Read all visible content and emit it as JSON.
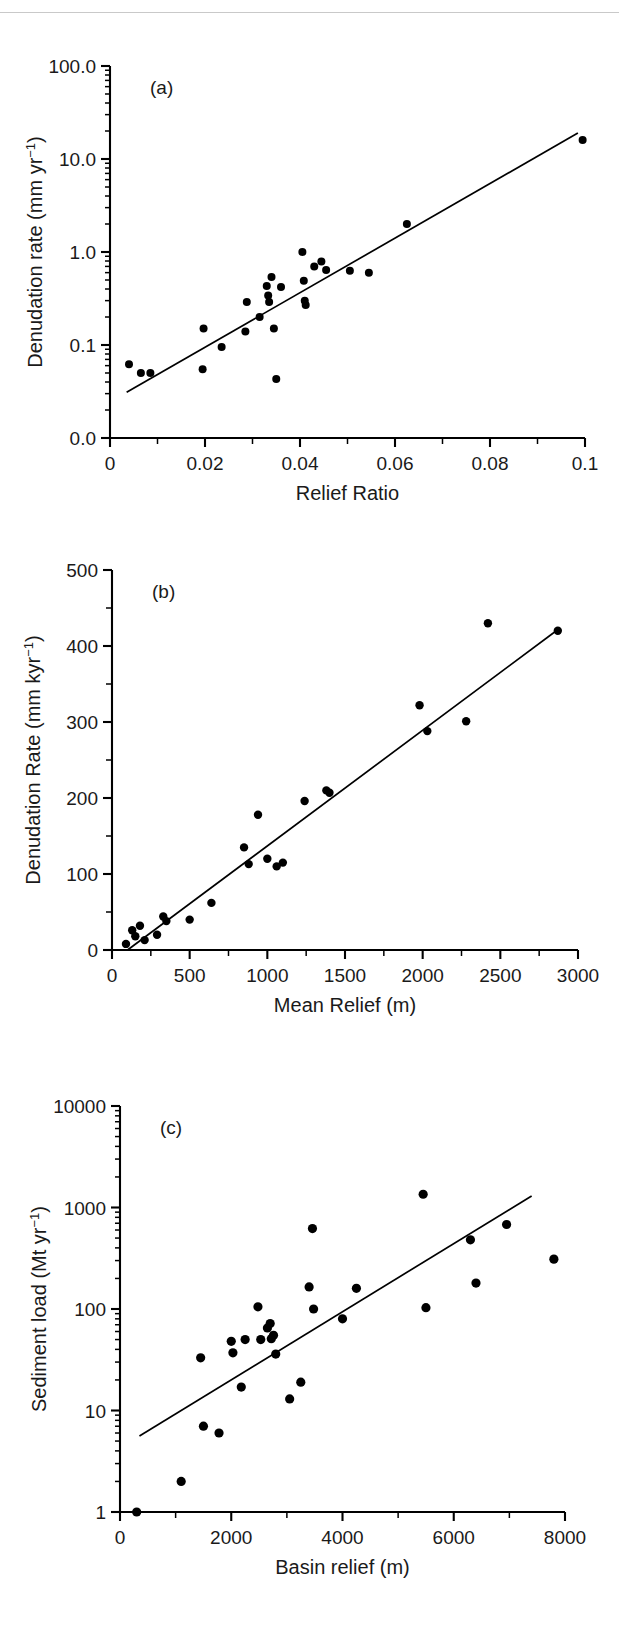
{
  "figure": {
    "background": "#ffffff",
    "rule_color": "#c9c9c9",
    "marker_color": "#000000",
    "line_color": "#000000"
  },
  "panels": [
    {
      "tag": "(a)",
      "xlabel": "Relief Ratio",
      "ylabel_main": "Denudation rate (mm yr",
      "ylabel_sup": "−1",
      "ylabel_close": ")",
      "ylabel_full": "Denudation rate (mm yr⁻¹)",
      "xticks": [
        "0",
        "0.02",
        "0.04",
        "0.06",
        "0.08",
        "0.1"
      ],
      "yticks": [
        "100.0",
        "10.0",
        "1.0",
        "0.1",
        "0.0"
      ]
    },
    {
      "tag": "(b)",
      "xlabel": "Mean Relief (m)",
      "ylabel_main": "Denudation Rate (mm kyr",
      "ylabel_sup": "−1",
      "ylabel_close": ")",
      "ylabel_full": "Denudation Rate (mm kyr⁻¹)",
      "xticks": [
        "0",
        "500",
        "1000",
        "1500",
        "2000",
        "2500",
        "3000"
      ],
      "yticks": [
        "500",
        "400",
        "300",
        "200",
        "100",
        "0"
      ]
    },
    {
      "tag": "(c)",
      "xlabel": "Basin relief (m)",
      "ylabel_main": "Sediment load (Mt yr",
      "ylabel_sup": "−1",
      "ylabel_close": ")",
      "ylabel_full": "Sediment load (Mt yr⁻¹)",
      "xticks": [
        "0",
        "2000",
        "4000",
        "6000",
        "8000"
      ],
      "yticks": [
        "10000",
        "1000",
        "100",
        "10",
        "1"
      ]
    }
  ],
  "chart_data": [
    {
      "type": "scatter",
      "panel": "a",
      "title": "(a)",
      "xlabel": "Relief Ratio",
      "ylabel": "Denudation rate (mm yr⁻¹)",
      "xlim": [
        0,
        0.1
      ],
      "ylim": [
        0.01,
        100
      ],
      "yscale": "log",
      "xscale": "linear",
      "grid": false,
      "legend": null,
      "xticks": [
        0,
        0.02,
        0.04,
        0.06,
        0.08,
        0.1
      ],
      "xtick_labels": [
        "0",
        "0.02",
        "0.04",
        "0.06",
        "0.08",
        "0.1"
      ],
      "yticks": [
        0.01,
        0.1,
        1,
        10,
        100
      ],
      "ytick_labels": [
        "0.0",
        "0.1",
        "1.0",
        "10.0",
        "100.0"
      ],
      "points": [
        {
          "x": 0.004,
          "y": 0.062
        },
        {
          "x": 0.0065,
          "y": 0.05
        },
        {
          "x": 0.0085,
          "y": 0.05
        },
        {
          "x": 0.0195,
          "y": 0.055
        },
        {
          "x": 0.0197,
          "y": 0.15
        },
        {
          "x": 0.0235,
          "y": 0.095
        },
        {
          "x": 0.0285,
          "y": 0.14
        },
        {
          "x": 0.0288,
          "y": 0.29
        },
        {
          "x": 0.0315,
          "y": 0.2
        },
        {
          "x": 0.033,
          "y": 0.43
        },
        {
          "x": 0.0333,
          "y": 0.34
        },
        {
          "x": 0.0335,
          "y": 0.29
        },
        {
          "x": 0.034,
          "y": 0.54
        },
        {
          "x": 0.0345,
          "y": 0.15
        },
        {
          "x": 0.035,
          "y": 0.043
        },
        {
          "x": 0.036,
          "y": 0.42
        },
        {
          "x": 0.0405,
          "y": 1.0
        },
        {
          "x": 0.0408,
          "y": 0.49
        },
        {
          "x": 0.041,
          "y": 0.3
        },
        {
          "x": 0.0412,
          "y": 0.27
        },
        {
          "x": 0.043,
          "y": 0.7
        },
        {
          "x": 0.0445,
          "y": 0.79
        },
        {
          "x": 0.0455,
          "y": 0.64
        },
        {
          "x": 0.0505,
          "y": 0.63
        },
        {
          "x": 0.0625,
          "y": 2.0
        },
        {
          "x": 0.0545,
          "y": 0.6
        },
        {
          "x": 0.0995,
          "y": 16.0
        }
      ],
      "fit_line": {
        "x0": 0.0035,
        "y0": 0.031,
        "x1": 0.0985,
        "y1": 19.0
      }
    },
    {
      "type": "scatter",
      "panel": "b",
      "title": "(b)",
      "xlabel": "Mean Relief (m)",
      "ylabel": "Denudation Rate (mm kyr⁻¹)",
      "xlim": [
        0,
        3000
      ],
      "ylim": [
        0,
        500
      ],
      "yscale": "linear",
      "xscale": "linear",
      "grid": false,
      "legend": null,
      "xticks": [
        0,
        500,
        1000,
        1500,
        2000,
        2500,
        3000
      ],
      "xtick_labels": [
        "0",
        "500",
        "1000",
        "1500",
        "2000",
        "2500",
        "3000"
      ],
      "yticks": [
        0,
        100,
        200,
        300,
        400,
        500
      ],
      "ytick_labels": [
        "0",
        "100",
        "200",
        "300",
        "400",
        "500"
      ],
      "points": [
        {
          "x": 90,
          "y": 8
        },
        {
          "x": 130,
          "y": 26
        },
        {
          "x": 150,
          "y": 18
        },
        {
          "x": 180,
          "y": 32
        },
        {
          "x": 210,
          "y": 13
        },
        {
          "x": 290,
          "y": 20
        },
        {
          "x": 330,
          "y": 44
        },
        {
          "x": 350,
          "y": 38
        },
        {
          "x": 500,
          "y": 40
        },
        {
          "x": 640,
          "y": 62
        },
        {
          "x": 850,
          "y": 135
        },
        {
          "x": 880,
          "y": 113
        },
        {
          "x": 940,
          "y": 178
        },
        {
          "x": 1000,
          "y": 120
        },
        {
          "x": 1060,
          "y": 110
        },
        {
          "x": 1100,
          "y": 115
        },
        {
          "x": 1240,
          "y": 196
        },
        {
          "x": 1380,
          "y": 210
        },
        {
          "x": 1400,
          "y": 207
        },
        {
          "x": 1980,
          "y": 322
        },
        {
          "x": 2030,
          "y": 288
        },
        {
          "x": 2280,
          "y": 301
        },
        {
          "x": 2420,
          "y": 430
        },
        {
          "x": 2870,
          "y": 420
        }
      ],
      "fit_line": {
        "x0": 100,
        "y0": 0,
        "x1": 2880,
        "y1": 423
      }
    },
    {
      "type": "scatter",
      "panel": "c",
      "title": "(c)",
      "xlabel": "Basin relief (m)",
      "ylabel": "Sediment load (Mt yr⁻¹)",
      "xlim": [
        0,
        8000
      ],
      "ylim": [
        1,
        10000
      ],
      "yscale": "log",
      "xscale": "linear",
      "grid": false,
      "legend": null,
      "xticks": [
        0,
        2000,
        4000,
        6000,
        8000
      ],
      "xtick_labels": [
        "0",
        "2000",
        "4000",
        "6000",
        "8000"
      ],
      "yticks": [
        1,
        10,
        100,
        1000,
        10000
      ],
      "ytick_labels": [
        "1",
        "10",
        "100",
        "1000",
        "10000"
      ],
      "points": [
        {
          "x": 300,
          "y": 1.0
        },
        {
          "x": 1100,
          "y": 2.0
        },
        {
          "x": 1450,
          "y": 33
        },
        {
          "x": 1500,
          "y": 7.0
        },
        {
          "x": 1780,
          "y": 6.0
        },
        {
          "x": 2000,
          "y": 48
        },
        {
          "x": 2030,
          "y": 37
        },
        {
          "x": 2180,
          "y": 17
        },
        {
          "x": 2250,
          "y": 50
        },
        {
          "x": 2480,
          "y": 105
        },
        {
          "x": 2530,
          "y": 50
        },
        {
          "x": 2650,
          "y": 65
        },
        {
          "x": 2700,
          "y": 72
        },
        {
          "x": 2720,
          "y": 51
        },
        {
          "x": 2760,
          "y": 55
        },
        {
          "x": 2800,
          "y": 36
        },
        {
          "x": 3050,
          "y": 13
        },
        {
          "x": 3250,
          "y": 19
        },
        {
          "x": 3400,
          "y": 165
        },
        {
          "x": 3460,
          "y": 620
        },
        {
          "x": 3480,
          "y": 100
        },
        {
          "x": 4000,
          "y": 80
        },
        {
          "x": 4250,
          "y": 160
        },
        {
          "x": 5450,
          "y": 1350
        },
        {
          "x": 5500,
          "y": 103
        },
        {
          "x": 6300,
          "y": 480
        },
        {
          "x": 6400,
          "y": 180
        },
        {
          "x": 6950,
          "y": 680
        },
        {
          "x": 7800,
          "y": 310
        }
      ],
      "fit_line": {
        "x0": 350,
        "y0": 5.6,
        "x1": 7400,
        "y1": 1300
      }
    }
  ]
}
